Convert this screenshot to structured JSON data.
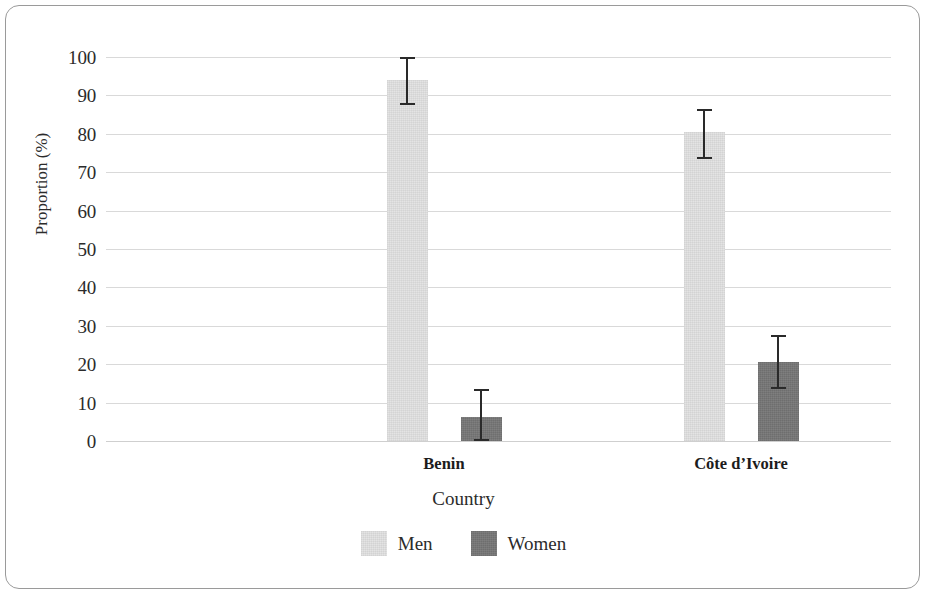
{
  "chart_data": {
    "type": "bar",
    "title": "",
    "xlabel": "Country",
    "ylabel": "Proportion (%)",
    "categories": [
      "Benin",
      "Côte d’Ivoire"
    ],
    "ylim": [
      0,
      100
    ],
    "yticks": [
      0,
      10,
      20,
      30,
      40,
      50,
      60,
      70,
      80,
      90,
      100
    ],
    "ytick_labels": [
      "0",
      "10",
      "20",
      "30",
      "40",
      "50",
      "60",
      "70",
      "80",
      "90",
      "100"
    ],
    "grid": true,
    "legend_position": "bottom",
    "error_bars": "95% confidence interval",
    "series": [
      {
        "name": "Men",
        "color": "#e2e2e2",
        "values": [
          94.0,
          80.5
        ],
        "error_low": [
          87.5,
          73.5
        ],
        "error_high": [
          100.0,
          86.5
        ]
      },
      {
        "name": "Women",
        "color": "#767676",
        "values": [
          6.3,
          20.5
        ],
        "error_low": [
          0.0,
          13.5
        ],
        "error_high": [
          13.5,
          27.5
        ]
      }
    ]
  },
  "axes": {
    "y_label": "Proportion (%)",
    "x_label": "Country"
  },
  "legend": {
    "items": [
      {
        "label": "Men",
        "color": "#e2e2e2"
      },
      {
        "label": "Women",
        "color": "#767676"
      }
    ]
  },
  "style": {
    "grid_color": "#d9d9d9",
    "frame_color": "#9a9a9a",
    "text_color": "#2b2b2b",
    "error_color": "#2a2a2a",
    "background": "#ffffff"
  }
}
